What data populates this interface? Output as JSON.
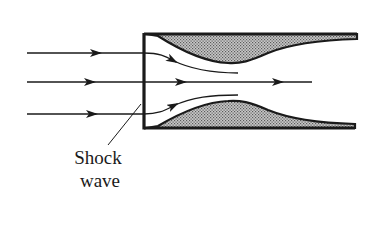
{
  "diagram": {
    "labels": {
      "shock_line1": "Shock",
      "shock_line2": "wave"
    },
    "colors": {
      "ink": "#1a1a1a",
      "fill": "#9a9a9a",
      "background": "#ffffff"
    },
    "streamlines": [
      {
        "name": "upper",
        "y": 53
      },
      {
        "name": "center",
        "y": 82
      },
      {
        "name": "lower",
        "y": 114
      }
    ]
  }
}
